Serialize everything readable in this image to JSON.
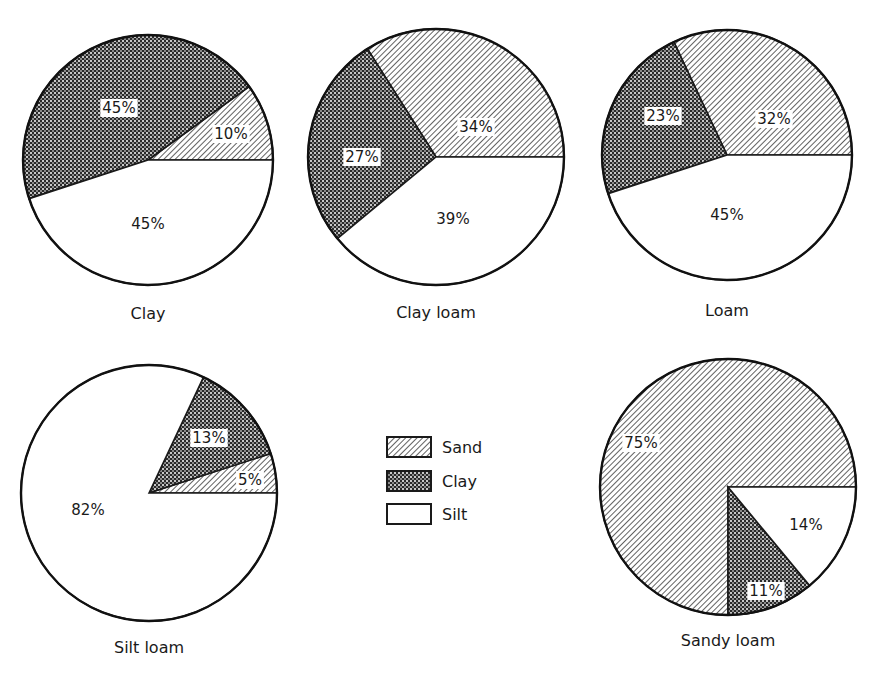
{
  "chart_data": {
    "type": "pie",
    "title": "",
    "legend": {
      "position": "center",
      "entries": [
        {
          "name": "Sand",
          "pattern": "diagonal-hatch",
          "color": "#ffffff"
        },
        {
          "name": "Clay",
          "pattern": "dense-checker",
          "color": "#555555"
        },
        {
          "name": "Silt",
          "pattern": "none",
          "color": "#ffffff"
        }
      ]
    },
    "charts": [
      {
        "name": "Clay",
        "slices": [
          {
            "label": "Sand",
            "value": 10
          },
          {
            "label": "Clay",
            "value": 45
          },
          {
            "label": "Silt",
            "value": 45
          }
        ]
      },
      {
        "name": "Clay loam",
        "slices": [
          {
            "label": "Sand",
            "value": 34
          },
          {
            "label": "Clay",
            "value": 27
          },
          {
            "label": "Silt",
            "value": 39
          }
        ]
      },
      {
        "name": "Loam",
        "slices": [
          {
            "label": "Sand",
            "value": 32
          },
          {
            "label": "Clay",
            "value": 23
          },
          {
            "label": "Silt",
            "value": 45
          }
        ]
      },
      {
        "name": "Silt loam",
        "slices": [
          {
            "label": "Sand",
            "value": 5
          },
          {
            "label": "Clay",
            "value": 13
          },
          {
            "label": "Silt",
            "value": 82
          }
        ]
      },
      {
        "name": "Sandy loam",
        "slices": [
          {
            "label": "Sand",
            "value": 75
          },
          {
            "label": "Clay",
            "value": 11
          },
          {
            "label": "Silt",
            "value": 14
          }
        ]
      }
    ]
  },
  "labels": {
    "clay": "Clay",
    "clay_loam": "Clay loam",
    "loam": "Loam",
    "silt_loam": "Silt loam",
    "sandy_loam": "Sandy loam"
  },
  "pct": {
    "clay": {
      "sand": "10%",
      "clay": "45%",
      "silt": "45%"
    },
    "clay_loam": {
      "sand": "34%",
      "clay": "27%",
      "silt": "39%"
    },
    "loam": {
      "sand": "32%",
      "clay": "23%",
      "silt": "45%"
    },
    "silt_loam": {
      "sand": "5%",
      "clay": "13%",
      "silt": "82%"
    },
    "sandy_loam": {
      "sand": "75%",
      "clay": "11%",
      "silt": "14%"
    }
  },
  "legend": {
    "sand": "Sand",
    "clay": "Clay",
    "silt": "Silt"
  }
}
